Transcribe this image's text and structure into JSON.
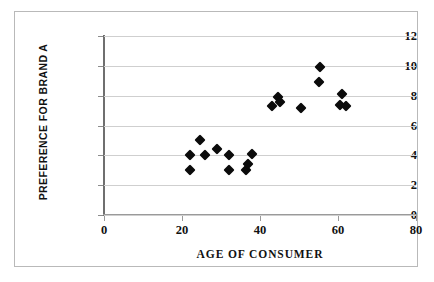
{
  "chart_data": {
    "type": "scatter",
    "title": "",
    "xlabel": "AGE OF CONSUMER",
    "ylabel": "PREFERENCE FOR BRAND A",
    "xlim": [
      0,
      80
    ],
    "ylim": [
      0,
      12
    ],
    "xticks": [
      0,
      20,
      40,
      60,
      80
    ],
    "yticks": [
      0,
      2,
      4,
      6,
      8,
      10,
      12
    ],
    "grid": "horizontal",
    "legend": "none",
    "marker": "filled-diamond",
    "marker_color": "#0b0b0b",
    "series": [
      {
        "name": "Consumers",
        "points": [
          {
            "x": 22.0,
            "y": 4.0
          },
          {
            "x": 22.0,
            "y": 3.0
          },
          {
            "x": 24.5,
            "y": 5.0
          },
          {
            "x": 26.0,
            "y": 4.0
          },
          {
            "x": 29.0,
            "y": 4.4
          },
          {
            "x": 32.0,
            "y": 4.0
          },
          {
            "x": 32.0,
            "y": 3.0
          },
          {
            "x": 36.5,
            "y": 3.0
          },
          {
            "x": 37.0,
            "y": 3.4
          },
          {
            "x": 38.0,
            "y": 4.1
          },
          {
            "x": 43.0,
            "y": 7.3
          },
          {
            "x": 44.5,
            "y": 7.9
          },
          {
            "x": 45.0,
            "y": 7.6
          },
          {
            "x": 50.5,
            "y": 7.2
          },
          {
            "x": 55.0,
            "y": 8.9
          },
          {
            "x": 55.5,
            "y": 9.9
          },
          {
            "x": 60.5,
            "y": 7.4
          },
          {
            "x": 61.0,
            "y": 8.1
          },
          {
            "x": 62.0,
            "y": 7.3
          }
        ]
      }
    ]
  },
  "axes": {
    "x_tick_labels": [
      "0",
      "20",
      "40",
      "60",
      "80"
    ],
    "y_tick_labels": [
      "0",
      "2",
      "4",
      "6",
      "8",
      "10",
      "12"
    ],
    "x_title": "AGE OF CONSUMER",
    "y_title": "PREFERENCE FOR BRAND A"
  },
  "colors": {
    "marker": "#0b0b0b",
    "gridline": "#cfcfcf",
    "axis": "#6f6f6f",
    "frame": "#b9b9b9",
    "background": "#ffffff",
    "text": "#111111"
  }
}
